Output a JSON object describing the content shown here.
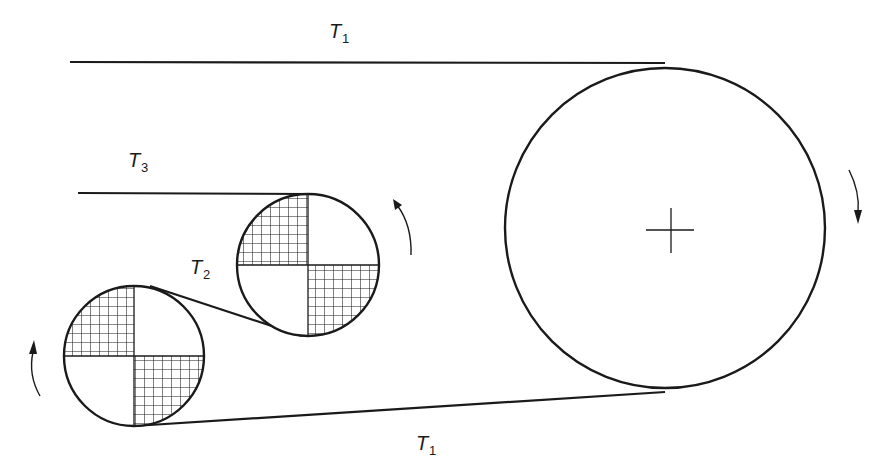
{
  "diagram": {
    "type": "belt-pulley tension diagram",
    "labels": {
      "top_belt": {
        "main": "T",
        "sub": "1"
      },
      "bottom_belt": {
        "main": "T",
        "sub": "1"
      },
      "middle_belt": {
        "main": "T",
        "sub": "2"
      },
      "input_strand": {
        "main": "T",
        "sub": "3"
      }
    },
    "pulleys": [
      {
        "id": "large-pulley",
        "cx": 665,
        "cy": 228,
        "r": 160,
        "hatched": false,
        "center_mark": true,
        "rotation": "clockwise"
      },
      {
        "id": "upper-small-pulley",
        "cx": 308,
        "cy": 265,
        "r": 71,
        "hatched": true,
        "rotation": "counterclockwise"
      },
      {
        "id": "lower-small-pulley",
        "cx": 134,
        "cy": 356,
        "r": 70,
        "hatched": true,
        "rotation": "counterclockwise"
      }
    ],
    "colors": {
      "stroke": "#1a1a1a",
      "background": "#ffffff"
    }
  }
}
